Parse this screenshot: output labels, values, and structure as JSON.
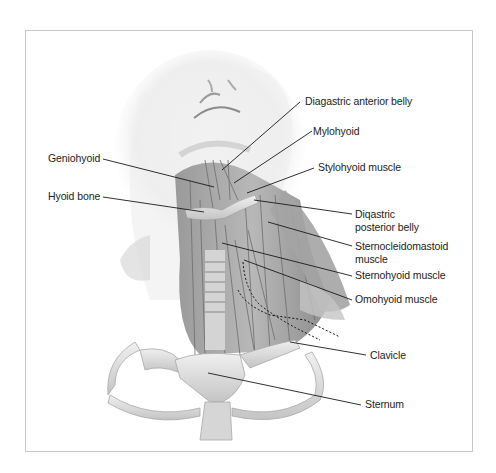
{
  "figure": {
    "colors": {
      "frame_border": "#c8c8c8",
      "leader_line": "#1a1a1a",
      "muscle": "#8a8a8a",
      "bone": "#dcdcdc",
      "skin": "#efefef"
    }
  },
  "labels": [
    {
      "id": "diagastric-anterior-belly",
      "text": "Diagastric anterior belly"
    },
    {
      "id": "mylohyoid",
      "text": "Mylohyoid"
    },
    {
      "id": "geniohyoid",
      "text": "Geniohyoid"
    },
    {
      "id": "stylohyoid-muscle",
      "text": "Stylohyoid muscle"
    },
    {
      "id": "hyoid-bone",
      "text": "Hyoid bone"
    },
    {
      "id": "diagastric-posterior-belly",
      "line1": "Diqastric",
      "line2": "posterior belly"
    },
    {
      "id": "sternocleidomastoid-muscle",
      "line1": "Sternocleidomastoid",
      "line2": "muscle"
    },
    {
      "id": "sternohyoid-muscle",
      "text": "Sternohyoid muscle"
    },
    {
      "id": "omohyoid-muscle",
      "text": "Omohyoid muscle"
    },
    {
      "id": "clavicle",
      "text": "Clavicle"
    },
    {
      "id": "sternum",
      "text": "Sternum"
    }
  ]
}
